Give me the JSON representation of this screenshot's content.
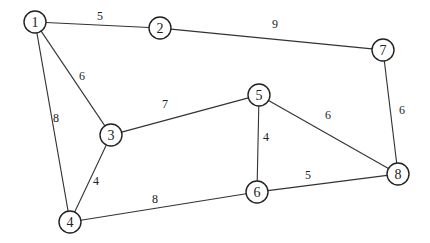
{
  "graph": {
    "type": "undirected-weighted",
    "node_radius": 11,
    "colors": {
      "stroke": "#222222",
      "edge": "#333333",
      "fill": "#ffffff"
    },
    "nodes": [
      {
        "id": "1",
        "label": "1",
        "x": 35,
        "y": 22
      },
      {
        "id": "2",
        "label": "2",
        "x": 160,
        "y": 28
      },
      {
        "id": "3",
        "label": "3",
        "x": 111,
        "y": 135
      },
      {
        "id": "4",
        "label": "4",
        "x": 70,
        "y": 222
      },
      {
        "id": "5",
        "label": "5",
        "x": 259,
        "y": 95
      },
      {
        "id": "6",
        "label": "6",
        "x": 257,
        "y": 192
      },
      {
        "id": "7",
        "label": "7",
        "x": 383,
        "y": 50
      },
      {
        "id": "8",
        "label": "8",
        "x": 398,
        "y": 174
      }
    ],
    "edges": [
      {
        "from": "1",
        "to": "2",
        "weight": "5",
        "lx": 100,
        "ly": 16
      },
      {
        "from": "2",
        "to": "7",
        "weight": "9",
        "lx": 275,
        "ly": 24
      },
      {
        "from": "1",
        "to": "3",
        "weight": "6",
        "lx": 82,
        "ly": 76
      },
      {
        "from": "1",
        "to": "4",
        "weight": "8",
        "lx": 56,
        "ly": 118
      },
      {
        "from": "3",
        "to": "5",
        "weight": "7",
        "lx": 165,
        "ly": 104
      },
      {
        "from": "3",
        "to": "4",
        "weight": "4",
        "lx": 96,
        "ly": 181
      },
      {
        "from": "5",
        "to": "6",
        "weight": "4",
        "lx": 266,
        "ly": 137
      },
      {
        "from": "5",
        "to": "8",
        "weight": "6",
        "lx": 328,
        "ly": 115
      },
      {
        "from": "7",
        "to": "8",
        "weight": "6",
        "lx": 402,
        "ly": 110
      },
      {
        "from": "4",
        "to": "6",
        "weight": "8",
        "lx": 155,
        "ly": 199
      },
      {
        "from": "6",
        "to": "8",
        "weight": "5",
        "lx": 308,
        "ly": 175
      }
    ]
  }
}
